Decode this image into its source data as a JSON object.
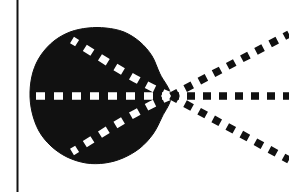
{
  "figure": {
    "title": "Convergent dashed rays meeting at a cusp on a filled blob",
    "type": "line-diagram",
    "background_color": "#ffffff",
    "ink_color": "#111111",
    "blob_fill_color": "#111111",
    "interior_dash_color": "#ffffff",
    "width": 289,
    "height": 192
  },
  "frame": {
    "left_rule": {
      "name": "left-vertical-rule",
      "x": 17.5,
      "y_top": 0,
      "y_bottom": 192,
      "stroke_width": 2.0,
      "color": "#111111"
    }
  },
  "blob": {
    "name": "filled-region",
    "fill": "#111111",
    "centroid_x": 96,
    "centroid_y": 96,
    "left_extent": 30,
    "right_cusp_x": 171,
    "top_extent": 28,
    "bottom_extent": 164,
    "outline_points": [
      [
        171,
        96
      ],
      [
        160,
        74
      ],
      [
        152,
        56
      ],
      [
        140,
        42
      ],
      [
        124,
        32
      ],
      [
        106,
        28
      ],
      [
        88,
        28
      ],
      [
        70,
        32
      ],
      [
        54,
        41
      ],
      [
        41,
        55
      ],
      [
        33,
        72
      ],
      [
        30,
        92
      ],
      [
        32,
        112
      ],
      [
        39,
        131
      ],
      [
        51,
        146
      ],
      [
        67,
        157
      ],
      [
        86,
        163
      ],
      [
        105,
        163
      ],
      [
        123,
        158
      ],
      [
        140,
        148
      ],
      [
        153,
        134
      ],
      [
        162,
        117
      ]
    ]
  },
  "rays": {
    "vertex": {
      "x": 171,
      "y": 96
    },
    "exterior": [
      {
        "name": "ray-upper",
        "angle_deg": 27.5,
        "x1": 171,
        "y1": 96,
        "x2": 289,
        "y2": 34,
        "dash": "8 8",
        "stroke_width": 7.5,
        "color": "#111111"
      },
      {
        "name": "ray-middle",
        "angle_deg": 0,
        "x1": 171,
        "y1": 96,
        "x2": 289,
        "y2": 96,
        "dash": "8 8",
        "stroke_width": 7.5,
        "color": "#111111"
      },
      {
        "name": "ray-lower",
        "angle_deg": -27.5,
        "x1": 171,
        "y1": 96,
        "x2": 289,
        "y2": 160,
        "dash": "8 8",
        "stroke_width": 7.5,
        "color": "#111111"
      }
    ],
    "interior": [
      {
        "name": "interior-curve-upper",
        "path": "M 171 96 C 140 84 108 62 72 40",
        "dash": "9 9",
        "stroke_width": 7.5,
        "color": "#ffffff"
      },
      {
        "name": "interior-line-middle",
        "x1": 171,
        "y1": 96,
        "x2": 26,
        "y2": 96,
        "dash": "9 9",
        "stroke_width": 7.5,
        "color": "#ffffff"
      },
      {
        "name": "interior-curve-lower",
        "path": "M 171 96 C 140 108 108 130 72 152",
        "dash": "9 9",
        "stroke_width": 7.5,
        "color": "#ffffff"
      }
    ]
  }
}
